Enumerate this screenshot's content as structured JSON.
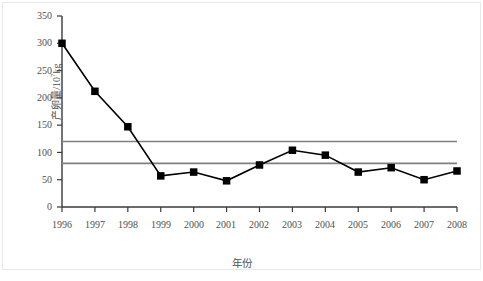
{
  "chart_data": {
    "type": "line",
    "title": "",
    "subtitle": "",
    "xlabel": "年份",
    "ylabel_prefix": "产卵量/10",
    "ylabel_exponent": "7",
    "ylabel_suffix": "kg",
    "ylabel_full": "产卵量/10⁷kg",
    "categories": [
      "1996",
      "1997",
      "1998",
      "1999",
      "2000",
      "2001",
      "2002",
      "2003",
      "2004",
      "2005",
      "2006",
      "2007",
      "2008"
    ],
    "x": [
      1996,
      1997,
      1998,
      1999,
      2000,
      2001,
      2002,
      2003,
      2004,
      2005,
      2006,
      2007,
      2008
    ],
    "values": [
      300,
      212,
      147,
      57,
      64,
      48,
      77,
      104,
      95,
      64,
      72,
      50,
      66
    ],
    "series": [
      {
        "name": "产卵量",
        "values": [
          300,
          212,
          147,
          57,
          64,
          48,
          77,
          104,
          95,
          64,
          72,
          50,
          66
        ],
        "marker": "filled-square",
        "color": "#000000"
      }
    ],
    "ylim": [
      0,
      350
    ],
    "yticks": [
      0,
      50,
      100,
      150,
      200,
      250,
      300,
      350
    ],
    "ytick_labels": [
      "0",
      "50",
      "100",
      "150",
      "200",
      "250",
      "300",
      "350"
    ],
    "xlim": [
      1996,
      2008
    ],
    "grid": false,
    "legend": "none",
    "reference_lines": [
      {
        "name": "upper-reference-line",
        "value": 120,
        "color": "#808080"
      },
      {
        "name": "lower-reference-line",
        "value": 80,
        "color": "#808080"
      }
    ],
    "axis_color": "#3a3a3a",
    "line_color": "#000000",
    "marker_color": "#000000"
  }
}
